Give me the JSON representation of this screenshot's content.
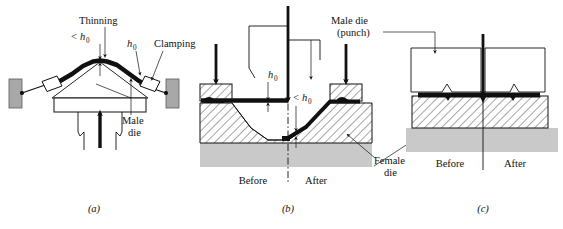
{
  "figure": {
    "panels": [
      {
        "id": "a",
        "caption": "(a)",
        "name": "stretch-forming",
        "labels": [
          {
            "key": "thinning",
            "text": "Thinning"
          },
          {
            "key": "lt_h0",
            "text": "<",
            "sub_base": "h",
            "sub": "0"
          },
          {
            "key": "h0_right",
            "text": "h",
            "sub": "0"
          },
          {
            "key": "clamping",
            "text": "Clamping"
          },
          {
            "key": "male_die_1",
            "text": "Male"
          },
          {
            "key": "male_die_2",
            "text": "die"
          }
        ]
      },
      {
        "id": "b",
        "caption": "(b)",
        "name": "deep-drawing-with-female-die",
        "labels": [
          {
            "key": "male_die_1",
            "text": "Male die"
          },
          {
            "key": "male_die_2",
            "text": "(punch)"
          },
          {
            "key": "h0",
            "text": "h",
            "sub": "0"
          },
          {
            "key": "lt_h0",
            "text": "<",
            "sub_base": "h",
            "sub": "0"
          },
          {
            "key": "before",
            "text": "Before"
          },
          {
            "key": "after",
            "text": "After"
          },
          {
            "key": "female_1",
            "text": "Female"
          },
          {
            "key": "female_2",
            "text": "die"
          }
        ]
      },
      {
        "id": "c",
        "caption": "(c)",
        "name": "embossing-coining",
        "labels": [
          {
            "key": "before",
            "text": "Before"
          },
          {
            "key": "after",
            "text": "After"
          }
        ]
      }
    ],
    "colors": {
      "ink": "#111111",
      "sheet_metal": "#101010",
      "die_grey": "#c9c9c9",
      "clamp_block_grey": "#a8a8a8",
      "background": "#ffffff"
    }
  }
}
